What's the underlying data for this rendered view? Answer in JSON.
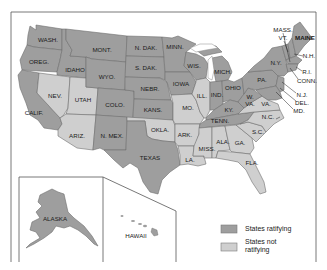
{
  "map": {
    "title": "",
    "colors": {
      "ratifying": "#9e9e9e",
      "not_ratifying": "#cfcfcf",
      "water": "#ffffff",
      "border": "#6f6f6f"
    },
    "states": [
      {
        "id": "WA",
        "label": "WASH.",
        "status": "ratifying"
      },
      {
        "id": "OR",
        "label": "OREG.",
        "status": "ratifying"
      },
      {
        "id": "CA",
        "label": "CALIF.",
        "status": "ratifying"
      },
      {
        "id": "ID",
        "label": "IDAHO",
        "status": "ratifying"
      },
      {
        "id": "NV",
        "label": "NEV.",
        "status": "not_ratifying"
      },
      {
        "id": "UT",
        "label": "UTAH",
        "status": "not_ratifying"
      },
      {
        "id": "AZ",
        "label": "ARIZ.",
        "status": "not_ratifying"
      },
      {
        "id": "MT",
        "label": "MONT.",
        "status": "ratifying"
      },
      {
        "id": "WY",
        "label": "WYO.",
        "status": "ratifying"
      },
      {
        "id": "CO",
        "label": "COLO.",
        "status": "ratifying"
      },
      {
        "id": "NM",
        "label": "N. MEX.",
        "status": "ratifying"
      },
      {
        "id": "ND",
        "label": "N. DAK.",
        "status": "ratifying"
      },
      {
        "id": "SD",
        "label": "S. DAK.",
        "status": "ratifying"
      },
      {
        "id": "NE",
        "label": "NEBR.",
        "status": "ratifying"
      },
      {
        "id": "KS",
        "label": "KANS.",
        "status": "ratifying"
      },
      {
        "id": "OK",
        "label": "OKLA.",
        "status": "not_ratifying"
      },
      {
        "id": "TX",
        "label": "TEXAS",
        "status": "ratifying"
      },
      {
        "id": "MN",
        "label": "MINN.",
        "status": "ratifying"
      },
      {
        "id": "IA",
        "label": "IOWA",
        "status": "ratifying"
      },
      {
        "id": "MO",
        "label": "MO.",
        "status": "not_ratifying"
      },
      {
        "id": "AR",
        "label": "ARK.",
        "status": "not_ratifying"
      },
      {
        "id": "LA",
        "label": "LA.",
        "status": "not_ratifying"
      },
      {
        "id": "WI",
        "label": "WIS.",
        "status": "ratifying"
      },
      {
        "id": "IL",
        "label": "ILL.",
        "status": "not_ratifying"
      },
      {
        "id": "MI",
        "label": "MICH.",
        "status": "ratifying"
      },
      {
        "id": "IN",
        "label": "IND.",
        "status": "ratifying"
      },
      {
        "id": "OH",
        "label": "OHIO",
        "status": "ratifying"
      },
      {
        "id": "KY",
        "label": "KY.",
        "status": "ratifying"
      },
      {
        "id": "TN",
        "label": "TENN.",
        "status": "ratifying"
      },
      {
        "id": "MS",
        "label": "MISS.",
        "status": "not_ratifying"
      },
      {
        "id": "AL",
        "label": "ALA.",
        "status": "not_ratifying"
      },
      {
        "id": "GA",
        "label": "GA.",
        "status": "not_ratifying"
      },
      {
        "id": "FL",
        "label": "FLA.",
        "status": "not_ratifying"
      },
      {
        "id": "SC",
        "label": "S.C.",
        "status": "not_ratifying"
      },
      {
        "id": "NC",
        "label": "N.C.",
        "status": "not_ratifying"
      },
      {
        "id": "VA",
        "label": "VA.",
        "status": "not_ratifying"
      },
      {
        "id": "WV",
        "label": "W. VA.",
        "status": "ratifying"
      },
      {
        "id": "PA",
        "label": "PA.",
        "status": "ratifying"
      },
      {
        "id": "NY",
        "label": "N.Y.",
        "status": "ratifying"
      },
      {
        "id": "ME",
        "label": "MAINE",
        "status": "ratifying"
      },
      {
        "id": "VT",
        "label": "VT.",
        "status": "ratifying"
      },
      {
        "id": "NH",
        "label": "N.H.",
        "status": "ratifying"
      },
      {
        "id": "MA",
        "label": "MASS.",
        "status": "ratifying"
      },
      {
        "id": "RI",
        "label": "R.I.",
        "status": "ratifying"
      },
      {
        "id": "CT",
        "label": "CONN.",
        "status": "ratifying"
      },
      {
        "id": "NJ",
        "label": "N.J.",
        "status": "ratifying"
      },
      {
        "id": "DE",
        "label": "DEL.",
        "status": "ratifying"
      },
      {
        "id": "MD",
        "label": "MD.",
        "status": "ratifying"
      },
      {
        "id": "AK",
        "label": "ALASKA",
        "status": "ratifying"
      },
      {
        "id": "HI",
        "label": "HAWAII",
        "status": "ratifying"
      }
    ]
  },
  "labels": {
    "WA": "WASH.",
    "OR": "OREG.",
    "CA": "CALIF.",
    "ID": "IDAHO",
    "NV": "NEV.",
    "UT": "UTAH",
    "AZ": "ARIZ.",
    "MT": "MONT.",
    "WY": "WYO.",
    "CO": "COLO.",
    "NM": "N. MEX.",
    "ND": "N. DAK.",
    "SD": "S. DAK.",
    "NE": "NEBR.",
    "KS": "KANS.",
    "OK": "OKLA.",
    "TX": "TEXAS",
    "MN": "MINN.",
    "IA": "IOWA",
    "MO": "MO.",
    "AR": "ARK.",
    "LA": "LA.",
    "WI": "WIS.",
    "IL": "ILL.",
    "MI": "MICH.",
    "IN": "IND.",
    "OH": "OHIO",
    "KY": "KY.",
    "TN": "TENN.",
    "MS": "MISS.",
    "AL": "ALA.",
    "GA": "GA.",
    "FL": "FLA.",
    "SC": "S.C.",
    "NC": "N.C.",
    "VA": "VA.",
    "WV1": "W.",
    "WV2": "VA.",
    "PA": "PA.",
    "NY": "N.Y.",
    "ME": "MAINE",
    "VT": "VT.",
    "NH": "N.H.",
    "MA": "MASS.",
    "RI": "R.I.",
    "CT": "CONN.",
    "NJ": "N.J.",
    "DE": "DEL.",
    "MD": "MD.",
    "AK": "ALASKA",
    "HI": "HAWAII"
  },
  "legend": {
    "items": [
      {
        "label": "States ratifying",
        "color": "#9e9e9e"
      },
      {
        "label_line1": "States not",
        "label_line2": "ratifying",
        "color": "#cfcfcf"
      }
    ]
  }
}
